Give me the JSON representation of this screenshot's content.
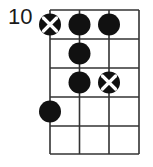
{
  "fret_label": "10",
  "grid": {
    "x_lines": [
      50,
      79.5,
      109,
      139
    ],
    "y_lines": [
      10,
      39,
      68,
      97,
      126,
      154
    ],
    "line_color": "#333333"
  },
  "dots": [
    {
      "string": 0,
      "fret": 0,
      "type": "x"
    },
    {
      "string": 1,
      "fret": 0,
      "type": "filled"
    },
    {
      "string": 2,
      "fret": 0,
      "type": "filled"
    },
    {
      "string": 1,
      "fret": 1,
      "type": "filled"
    },
    {
      "string": 1,
      "fret": 2,
      "type": "filled"
    },
    {
      "string": 2,
      "fret": 2,
      "type": "x"
    },
    {
      "string": 0,
      "fret": 3,
      "type": "filled"
    }
  ],
  "colors": {
    "dot": "#111111",
    "x_mark": "#ffffff"
  }
}
